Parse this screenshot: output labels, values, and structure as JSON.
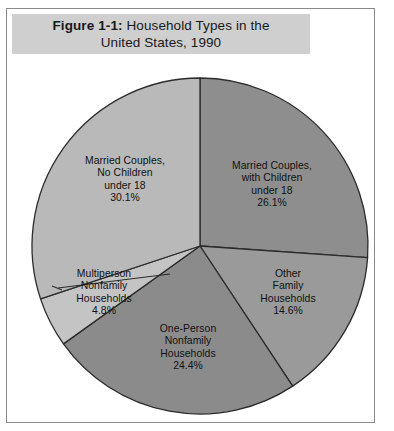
{
  "figure": {
    "label": "Figure 1-1:",
    "title_line1": " Household Types in the",
    "title_line2": "United States, 1990",
    "title_full": "Figure 1-1: Household Types in the United States, 1990"
  },
  "colors": {
    "title_band": "#cfcfcf",
    "frame": "#8a8a8a",
    "page_background": "#ffffff",
    "slice_outline": "#2b2b2b",
    "leader_line": "#2b2b2b"
  },
  "chart_data": {
    "type": "pie",
    "xlabel": "",
    "ylabel": "",
    "legend_position": "none",
    "grid": false,
    "start_angle_deg": 0,
    "direction": "clockwise",
    "units": "percent",
    "total": 100.0,
    "categories": [
      "Married Couples, with Children under 18",
      "Other Family Households",
      "One-Person Nonfamily Households",
      "Multiperson Nonfamily Households",
      "Married Couples, No Children under 18"
    ],
    "values": [
      26.1,
      14.6,
      24.4,
      4.8,
      30.1
    ],
    "slices": [
      {
        "key": "married-with-children",
        "label_lines": "Married Couples,\nwith Children\nunder 18\n26.1%",
        "name": "Married Couples, with Children under 18",
        "value": 26.1,
        "value_label": "26.1%",
        "color": "#8e8e8e"
      },
      {
        "key": "other-family",
        "label_lines": "Other\nFamily\nHouseholds\n14.6%",
        "name": "Other Family Households",
        "value": 14.6,
        "value_label": "14.6%",
        "color": "#9a9a9a"
      },
      {
        "key": "one-person-nonfamily",
        "label_lines": "One-Person\nNonfamily\nHouseholds\n24.4%",
        "name": "One-Person Nonfamily Households",
        "value": 24.4,
        "value_label": "24.4%",
        "color": "#8b8b8b"
      },
      {
        "key": "multiperson-nonfamily",
        "label_lines": "Multiperson\nNonfamily\nHouseholds\n4.8%",
        "name": "Multiperson Nonfamily Households",
        "value": 4.8,
        "value_label": "4.8%",
        "color": "#c4c4c4"
      },
      {
        "key": "married-no-children",
        "label_lines": "Married Couples,\nNo Children\nunder 18\n30.1%",
        "name": "Married Couples, No Children under 18",
        "value": 30.1,
        "value_label": "30.1%",
        "color": "#b9b9b9"
      }
    ]
  }
}
